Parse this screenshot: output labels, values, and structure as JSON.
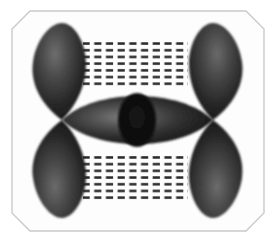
{
  "figure": {
    "alt_description": "Grayscale diagram of four teardrop orbital lobes at the corners with a central lens-shaped bonding region and dashed hatched fields",
    "width": 276,
    "height": 242,
    "background_color": "#ffffff"
  },
  "frame": {
    "name": "chamfered-panel",
    "fill": "#fdfdfd",
    "stroke": "#c9c9c9",
    "stroke_width": 1.4,
    "chamfer": 18,
    "inset": 12
  },
  "palette": {
    "lobe_dark": "#1b1b1b",
    "lobe_mid": "#3a3a3a",
    "lobe_highlight": "#6e6e6e",
    "lens_dark": "#202020",
    "lens_highlight": "#7a7a7a",
    "pupil": "#0b0b0b",
    "hatch_dash": "#2a2a2a",
    "frame_stroke": "#c9c9c9",
    "paper": "#fdfdfd"
  },
  "lobes": [
    {
      "id": "lobe-top-left",
      "label": "top-left lobe",
      "tip_x": 62,
      "tip_y": 120,
      "bulb_cx": 58,
      "bulb_cy": 60,
      "rx": 27,
      "ry": 38
    },
    {
      "id": "lobe-top-right",
      "label": "top-right lobe",
      "tip_x": 213,
      "tip_y": 120,
      "bulb_cx": 217,
      "bulb_cy": 60,
      "rx": 27,
      "ry": 38
    },
    {
      "id": "lobe-bottom-left",
      "label": "bottom-left lobe",
      "tip_x": 62,
      "tip_y": 120,
      "bulb_cx": 58,
      "bulb_cy": 181,
      "rx": 27,
      "ry": 38
    },
    {
      "id": "lobe-bottom-right",
      "label": "bottom-right lobe",
      "tip_x": 213,
      "tip_y": 120,
      "bulb_cx": 217,
      "bulb_cy": 181,
      "rx": 27,
      "ry": 38
    }
  ],
  "lens": {
    "id": "central-lens",
    "label": "central overlap lens",
    "left_x": 62,
    "right_x": 213,
    "center_y": 120,
    "half_height": 30
  },
  "pupil": {
    "id": "central-node",
    "label": "central nodal ellipse",
    "cx": 137,
    "cy": 120,
    "rx": 19,
    "ry": 27
  },
  "hatch_fields": [
    {
      "id": "hatch-upper",
      "label": "upper dashed field",
      "x": 83,
      "y": 39,
      "width": 105,
      "height": 47,
      "rows": 7,
      "cols": 9,
      "dash_length": 7,
      "dash_thickness": 2.4
    },
    {
      "id": "hatch-lower",
      "label": "lower dashed field",
      "x": 83,
      "y": 155,
      "width": 105,
      "height": 47,
      "rows": 7,
      "cols": 9,
      "dash_length": 7,
      "dash_thickness": 2.4
    }
  ],
  "watermark": {
    "visible": true,
    "text": "",
    "opacity": 0.16,
    "y": 214
  }
}
